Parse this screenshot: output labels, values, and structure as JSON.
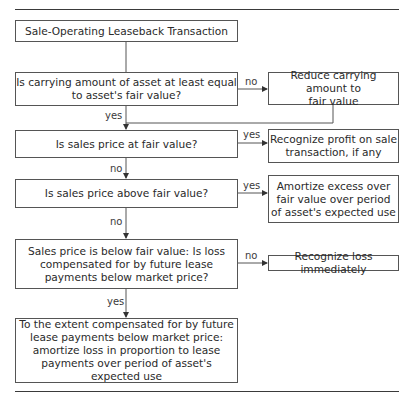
{
  "flowchart": {
    "start": "Sale-Operating Leaseback Transaction",
    "q1": "Is carrying amount of asset at least equal\nto asset's fair value?",
    "a1_no": "Reduce carrying amount to\nfair value",
    "q2": "Is sales price at fair value?",
    "a2_yes": "Recognize profit on sale\ntransaction, if any",
    "q3": "Is sales price above fair value?",
    "a3_yes": "Amortize excess over\nfair value over period\nof asset's expected use",
    "q4": "Sales price is below fair value: Is loss\ncompensated for by future lease\npayments below market price?",
    "a4_no": "Recognize loss immediately",
    "end": "To the extent compensated for by future\nlease payments below market price:\namortize loss in proportion to lease\npayments over period of asset's expected use"
  },
  "edge_labels": {
    "q1_no": "no",
    "q1_yes": "yes",
    "q2_yes": "yes",
    "q2_no": "no",
    "q3_yes": "yes",
    "q3_no": "no",
    "q4_no": "no",
    "q4_yes": "yes"
  },
  "colors": {
    "line": "#555555",
    "text": "#2a2a2a",
    "background": "#ffffff"
  }
}
